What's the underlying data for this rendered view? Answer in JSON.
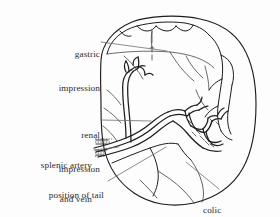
{
  "figure": {
    "background_color": "#fdfdfd",
    "ink_color": "#1d1d1d",
    "leader_color": "#6f6f72"
  },
  "labels": [
    {
      "id": "gastric-impression",
      "line1": "gastric",
      "line2": "impression",
      "align": "right",
      "x": 18,
      "y": 26,
      "width": 82
    },
    {
      "id": "renal-impression",
      "line1": "renal",
      "line2": "impression",
      "align": "right",
      "x": 22,
      "y": 107,
      "width": 78
    },
    {
      "id": "splenic-artery-and-vein",
      "line1": "splenic artery",
      "line2": "and vein",
      "align": "right",
      "x": 8,
      "y": 137,
      "width": 84
    },
    {
      "id": "position-of-tail-of-pancreas",
      "line1": "position of tail",
      "line2": "of pancreas",
      "align": "right",
      "x": 12,
      "y": 167,
      "width": 92
    },
    {
      "id": "colic-impression",
      "line1": "colic",
      "line2": "impression",
      "align": "left",
      "x": 203,
      "y": 182,
      "width": 74
    }
  ],
  "leader_lines": [
    {
      "id": "leader-gastric-impression",
      "from": [
        101,
        42
      ],
      "to": [
        167,
        51
      ]
    },
    {
      "id": "leader-renal-impression",
      "from": [
        101,
        120
      ],
      "to": [
        151,
        121
      ]
    },
    {
      "id": "leader-splenic-artery",
      "from": [
        94,
        150
      ],
      "to": [
        119,
        147
      ]
    },
    {
      "id": "leader-position-of-tail",
      "from": [
        108,
        181
      ],
      "to": [
        166,
        147
      ]
    },
    {
      "id": "leader-colic-impression",
      "from": [
        219,
        189
      ],
      "to": [
        186,
        162
      ]
    }
  ],
  "drawing": {
    "outline_name": "spleen-outline",
    "features": [
      "superior-notched-border",
      "hilum",
      "splenic-vessels",
      "gastric-impression-surface",
      "renal-impression-surface",
      "colic-impression-surface",
      "pancreatic-tail-groove"
    ]
  }
}
